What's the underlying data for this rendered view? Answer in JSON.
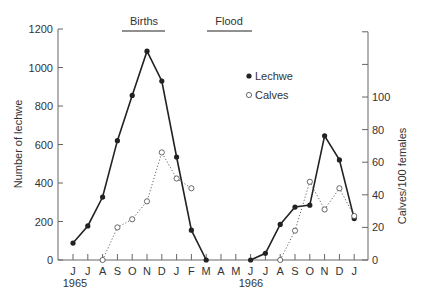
{
  "chart_data": {
    "type": "line",
    "title": "",
    "xlabel": "",
    "ylabel": "Number of lechwe",
    "ylabel_right": "Calves/100 females",
    "ylim": [
      0,
      1200
    ],
    "ylim_right": [
      0,
      140
    ],
    "yticks": [
      0,
      200,
      400,
      600,
      800,
      1000,
      1200
    ],
    "yticks_right": [
      0,
      20,
      40,
      60,
      80,
      100
    ],
    "yticks_right_unlabeled": [
      120,
      140
    ],
    "grid": false,
    "legend_position": "upper-right-inside",
    "categories": [
      "J",
      "J",
      "A",
      "S",
      "O",
      "N",
      "D",
      "J",
      "F",
      "M",
      "A",
      "M",
      "J",
      "J",
      "A",
      "S",
      "O",
      "N",
      "D",
      "J"
    ],
    "year_labels": [
      {
        "label": "1965",
        "index": 0
      },
      {
        "label": "1966",
        "index": 12
      }
    ],
    "annotations": [
      {
        "label": "Births",
        "from_index": 3,
        "to_index": 7
      },
      {
        "label": "Flood",
        "from_index": 9.5,
        "to_index": 12.5
      }
    ],
    "series": [
      {
        "name": "Lechwe",
        "axis": "left",
        "marker": "filled-circle",
        "line": "solid",
        "values": [
          88,
          177,
          327,
          620,
          855,
          1085,
          930,
          535,
          155,
          0,
          null,
          null,
          0,
          35,
          185,
          275,
          285,
          645,
          520,
          215
        ]
      },
      {
        "name": "Calves",
        "axis": "right",
        "marker": "open-circle",
        "line": "dotted",
        "values": [
          null,
          null,
          0,
          20,
          25,
          36,
          66,
          50,
          44,
          null,
          null,
          null,
          null,
          null,
          0,
          18,
          48,
          31,
          44,
          27
        ]
      }
    ]
  },
  "legend": {
    "items": [
      {
        "label": "Lechwe",
        "marker": "filled"
      },
      {
        "label": "Calves",
        "marker": "open"
      }
    ]
  },
  "annotations": {
    "births": "Births",
    "flood": "Flood"
  },
  "axes": {
    "left_title": "Number of lechwe",
    "right_title": "Calves/100 females",
    "year_1965": "1965",
    "year_1966": "1966"
  },
  "colors": {
    "axis": "#666666",
    "line": "#222222",
    "text": "#333333"
  }
}
